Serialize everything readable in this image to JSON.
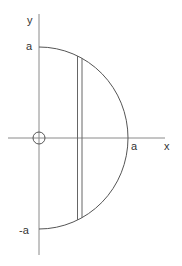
{
  "diagram": {
    "labels": {
      "y_axis": "y",
      "x_axis": "x",
      "top": "a",
      "bottom": "-a",
      "right": "a"
    },
    "colors": {
      "axis": "#8a8a8a",
      "curve": "#555555",
      "text": "#333333"
    }
  }
}
